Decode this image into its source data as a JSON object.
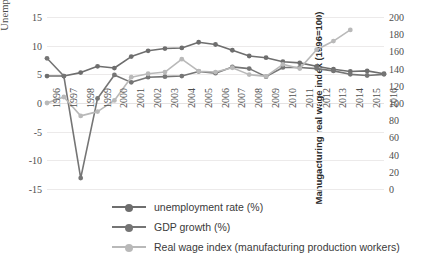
{
  "chart_data": {
    "type": "line",
    "title": "",
    "xlabel": "",
    "ylabel": "Unemploment Rate and GDP growth rate",
    "y2label": "Manugacturing real wage index (1996=100)",
    "grid": true,
    "legend_position": "bottom",
    "categories": [
      "1996",
      "1997",
      "1998",
      "1999",
      "2000",
      "2001",
      "2002",
      "2003",
      "2004",
      "2005",
      "2006",
      "2007",
      "2008",
      "2009",
      "2010",
      "2011",
      "2012",
      "2013",
      "2014",
      "2015",
      "2016"
    ],
    "ylim": [
      -15,
      15
    ],
    "yticks": [
      15,
      10,
      5,
      0,
      -5,
      -10,
      -15
    ],
    "y2lim": [
      0,
      200
    ],
    "y2ticks": [
      200,
      180,
      160,
      140,
      120,
      100,
      80,
      60,
      40,
      20,
      0
    ],
    "series": [
      {
        "name": "unemployment rate (%)",
        "axis": "left",
        "color": "#6e6e6e",
        "values": [
          4.7,
          4.7,
          5.3,
          6.4,
          6.1,
          8.1,
          9.1,
          9.5,
          9.6,
          10.6,
          10.2,
          9.2,
          8.2,
          7.9,
          7.2,
          7.0,
          6.4,
          5.9,
          5.5,
          5.6,
          5.1
        ]
      },
      {
        "name": "GDP growth (%)",
        "axis": "left",
        "color": "#757575",
        "values": [
          7.8,
          4.7,
          -13.1,
          0.8,
          4.9,
          3.6,
          4.5,
          4.6,
          4.7,
          5.5,
          5.2,
          6.3,
          6.0,
          4.6,
          6.2,
          6.2,
          6.0,
          5.6,
          5.0,
          4.8,
          5.0
        ]
      },
      {
        "name": "Real wage index (manufacturing production workers)",
        "axis": "right",
        "color": "#b9b9b9",
        "values": [
          100,
          107,
          85,
          90,
          103,
          130,
          134,
          136,
          151,
          137,
          136,
          141,
          133,
          131,
          145,
          140,
          162,
          172,
          185,
          null,
          null
        ]
      }
    ]
  },
  "legend": {
    "items": [
      {
        "label": "unemployment rate (%)",
        "color": "#6e6e6e"
      },
      {
        "label": "GDP growth (%)",
        "color": "#757575"
      },
      {
        "label": "Real wage index (manufacturing production workers)",
        "color": "#b9b9b9"
      }
    ]
  }
}
